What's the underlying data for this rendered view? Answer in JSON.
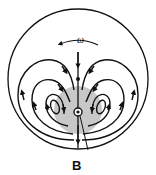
{
  "diagram": {
    "type": "field-line diagram",
    "labels": {
      "omega": "ω",
      "point": "B"
    },
    "elements": {
      "outer_circle": {
        "cx": 78,
        "cy": 79,
        "r": 70
      },
      "shaded_region": {
        "cx": 78,
        "cy": 110,
        "r": 24,
        "color": "#c8c8c8"
      },
      "center_marker": {
        "cx": 78,
        "cy": 112
      },
      "rotation_arrow": {
        "direction": "counter-clockwise"
      },
      "loops_per_side": 3,
      "axis_line_direction": "downward"
    },
    "colors": {
      "line": "#111111",
      "shade": "#c8c8c8",
      "background": "#ffffff"
    }
  }
}
